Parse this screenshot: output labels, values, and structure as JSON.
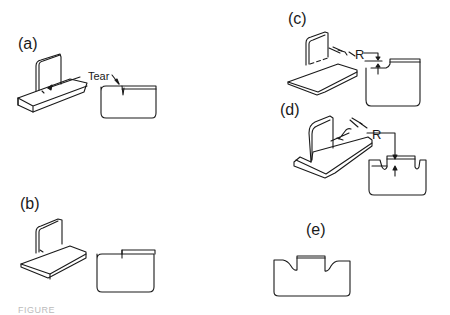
{
  "figure": {
    "panels": [
      {
        "id": "a",
        "label": "(a)",
        "callout": "Tear"
      },
      {
        "id": "b",
        "label": "(b)"
      },
      {
        "id": "c",
        "label": "(c)",
        "dimension": "R"
      },
      {
        "id": "d",
        "label": "(d)",
        "dimension": "R"
      },
      {
        "id": "e",
        "label": "(e)"
      }
    ],
    "caption": "FIGURE"
  },
  "colors": {
    "line": "#1a1a1a",
    "background": "#ffffff"
  }
}
